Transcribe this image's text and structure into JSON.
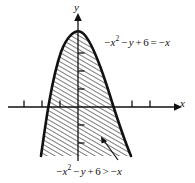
{
  "figure": {
    "kind": "coordinate-plane-graph",
    "background_color": "#ffffff",
    "ink_color": "#111111"
  },
  "axes": {
    "x_label": "x",
    "y_label": "y",
    "origin_px": [
      78,
      107
    ],
    "x_axis_px": {
      "x1": 8,
      "x2": 178,
      "y": 107
    },
    "y_axis_px": {
      "x": 78,
      "y1": 14,
      "y2": 161
    },
    "unit_px": 18,
    "x_ticks_left_px": [
      24,
      42,
      60
    ],
    "x_ticks_right_px": [
      132,
      150
    ],
    "y_ticks_up_px": [
      53,
      71,
      89
    ],
    "y_ticks_down_px": [
      125,
      143
    ],
    "tick_length_px": 7,
    "grid": false,
    "tick_labels_shown": false,
    "arrowheads": [
      "x-positive",
      "y-positive"
    ]
  },
  "curve": {
    "description": "downward-opening parabola boundary, drawn as a heavy solid curve",
    "equation_text": "-x^2 - y + 6 = -x",
    "vertex_px": [
      81,
      32
    ],
    "left_x_intercept_px": [
      54,
      107
    ],
    "right_x_intercept_px": [
      116,
      107
    ],
    "left_bottom_px": [
      41,
      156
    ],
    "right_bottom_px": [
      131,
      156
    ],
    "stroke_width_px": 2.6,
    "style": "solid"
  },
  "shaded_region": {
    "description": "region below/inside the parabola, filled with diagonal hatching",
    "inequality_text": "-x^2 - y + 6 > -x",
    "hatch_angle_deg": 60,
    "hatch_spacing_px": 4,
    "hatch_stroke_width_px": 1.1,
    "clipped_bottom_px": 156
  },
  "labels": {
    "equality": {
      "name": "equation-of-boundary",
      "parts": [
        "−",
        "x",
        "2",
        "−",
        "y",
        "+",
        "6",
        "=",
        "−",
        "x"
      ],
      "plain_text": "−x² − y + 6 = −x",
      "position_px": [
        104,
        36
      ]
    },
    "inequality": {
      "name": "inequality-of-region",
      "parts": [
        "−",
        "x",
        "2",
        "−",
        "y",
        "+",
        "6",
        ">",
        "−",
        "x"
      ],
      "plain_text": "−x² − y + 6 > −x",
      "position_px": [
        56,
        165
      ]
    }
  },
  "leader_arrow": {
    "name": "region-callout-arrow",
    "from_px": [
      118,
      160
    ],
    "to_px": [
      101,
      138
    ],
    "description": "arrow from the inequality label up-left into the hatched region"
  },
  "symbols": {
    "minus": "−",
    "plus": "+",
    "equals": "=",
    "greater_than": ">",
    "squared": "2"
  }
}
